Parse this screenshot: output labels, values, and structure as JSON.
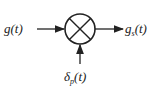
{
  "diagram": {
    "type": "block-diagram",
    "input": {
      "label_main": "g",
      "label_arg": "(t)"
    },
    "output": {
      "label_main": "g",
      "label_sub": "s",
      "label_arg": "(t)"
    },
    "modulator": {
      "label_main": "δ",
      "label_sub": "p",
      "label_arg": "(t)"
    },
    "block": {
      "symbol": "multiplier",
      "shape": "circle-with-x"
    },
    "colors": {
      "stroke": "#222222",
      "background": "#ffffff"
    }
  }
}
